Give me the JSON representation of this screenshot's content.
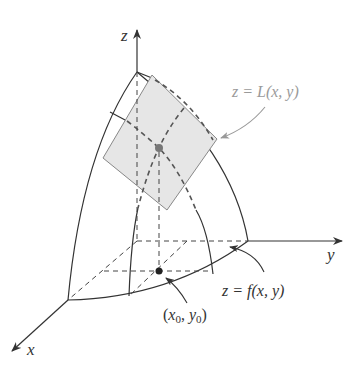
{
  "diagram": {
    "axes": {
      "x_label": "x",
      "y_label": "y",
      "z_label": "z"
    },
    "annotations": {
      "tangent_plane": "z = L(x, y)",
      "surface": "z = f(x, y)",
      "base_point_x": "x",
      "base_point_x_sub": "0",
      "base_point_sep": ", ",
      "base_point_y": "y",
      "base_point_y_sub": "0",
      "base_point_open": "(",
      "base_point_close": ")"
    },
    "colors": {
      "line": "#333333",
      "plane_fill": "#e6e6e6",
      "plane_stroke": "#888888",
      "label_gray": "#9a9a9a",
      "point": "#333333",
      "plane_point": "#777777"
    }
  }
}
